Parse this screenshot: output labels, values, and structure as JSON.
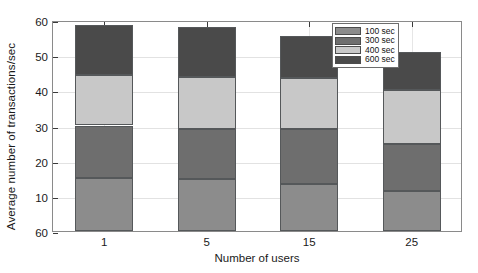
{
  "chart_data": {
    "type": "bar",
    "subtype": "stacked-vertical",
    "title": "",
    "xlabel": "Number of users",
    "ylabel": "Average number of transactions/sec",
    "categories": [
      "1",
      "5",
      "15",
      "25"
    ],
    "ylim": [
      0,
      60
    ],
    "ytick_labels": [
      "60",
      "50",
      "40",
      "30",
      "20",
      "10",
      "60"
    ],
    "ytick_values": [
      60,
      50,
      40,
      30,
      20,
      10,
      0
    ],
    "grid": true,
    "legend_position": "top-right",
    "series": [
      {
        "name": "100 sec",
        "color": "#8c8c8c",
        "values": [
          15.0,
          14.7,
          13.5,
          11.5
        ]
      },
      {
        "name": "300 sec",
        "color": "#6e6e6e",
        "values": [
          15.0,
          14.3,
          15.5,
          13.2
        ]
      },
      {
        "name": "400 sec",
        "color": "#c8c8c8",
        "values": [
          14.3,
          14.8,
          14.5,
          15.3
        ]
      },
      {
        "name": "600 sec",
        "color": "#4a4a4a",
        "values": [
          14.3,
          14.2,
          12.0,
          10.8
        ]
      }
    ],
    "stack_tops": [
      58.6,
      58.0,
      55.5,
      50.8
    ],
    "stack_boundaries": [
      [
        15.0,
        30.0,
        44.3,
        58.6
      ],
      [
        14.7,
        29.0,
        43.8,
        58.0
      ],
      [
        13.5,
        29.0,
        43.5,
        55.5
      ],
      [
        11.5,
        24.7,
        40.0,
        50.8
      ]
    ]
  }
}
